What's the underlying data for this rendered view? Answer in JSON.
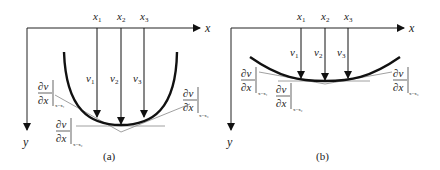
{
  "panels": [
    {
      "id": "a",
      "caption": "(a)",
      "x_axis_label": "x",
      "y_axis_label": "y",
      "positions": [
        {
          "label": "x",
          "sub": "1",
          "x": 97
        },
        {
          "label": "x",
          "sub": "2",
          "x": 121
        },
        {
          "label": "x",
          "sub": "3",
          "x": 144
        }
      ],
      "deflections": [
        {
          "label": "v",
          "sub": "1"
        },
        {
          "label": "v",
          "sub": "2"
        },
        {
          "label": "v",
          "sub": "3"
        }
      ],
      "slopes": [
        {
          "num": "∂v",
          "den": "∂x",
          "eval": "x=x₁"
        },
        {
          "num": "∂v",
          "den": "∂x",
          "eval": "x=x₂"
        },
        {
          "num": "∂v",
          "den": "∂x",
          "eval": "x=x₃"
        }
      ]
    },
    {
      "id": "b",
      "caption": "(b)",
      "x_axis_label": "x",
      "y_axis_label": "y",
      "positions": [
        {
          "label": "x",
          "sub": "1",
          "x": 301
        },
        {
          "label": "x",
          "sub": "2",
          "x": 325
        },
        {
          "label": "x",
          "sub": "3",
          "x": 348
        }
      ],
      "deflections": [
        {
          "label": "v",
          "sub": "1"
        },
        {
          "label": "v",
          "sub": "2"
        },
        {
          "label": "v",
          "sub": "3"
        }
      ],
      "slopes": [
        {
          "num": "∂v",
          "den": "∂x",
          "eval": "x=x₁"
        },
        {
          "num": "∂v",
          "den": "∂x",
          "eval": "x=x₂"
        },
        {
          "num": "∂v",
          "den": "∂x",
          "eval": "x=x₃"
        }
      ]
    }
  ],
  "colors": {
    "curve": "#111111",
    "axis": "#222222",
    "tangent": "#888888"
  }
}
